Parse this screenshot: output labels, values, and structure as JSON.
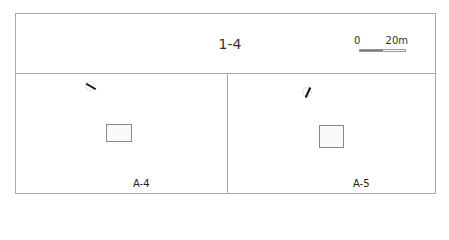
{
  "header": {
    "title": "1-4",
    "scale_bar": {
      "start_label": "0",
      "end_label": "20m"
    }
  },
  "panels": [
    {
      "label": "A-4",
      "north_arrow": {
        "icon": "north-arrow-icon",
        "rotation_deg": -60
      }
    },
    {
      "label": "A-5",
      "north_arrow": {
        "icon": "north-arrow-icon",
        "rotation_deg": 25
      }
    }
  ],
  "colors": {
    "border": "#a8a8a8",
    "scale_fill": "#777777"
  }
}
